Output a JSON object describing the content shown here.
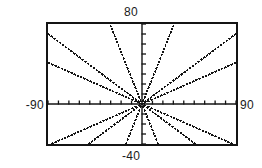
{
  "screen": {
    "type": "graphing-calculator-viewport",
    "background_color": "#ffffff",
    "ink_color": "#141414"
  },
  "labels": {
    "ymax": "80",
    "ymin": "-40",
    "xmin": "-90",
    "xmax": "90"
  },
  "chart_data": {
    "type": "line",
    "title": "",
    "xlabel": "",
    "ylabel": "",
    "xlim": [
      -90,
      90
    ],
    "ylim": [
      -40,
      80
    ],
    "xtick_spacing": 10,
    "ytick_spacing": 10,
    "grid": false,
    "legend": "none",
    "tick_labels": {
      "x": [
        "-90",
        "90"
      ],
      "y": [
        "80",
        "-40"
      ]
    },
    "series": [
      {
        "name": "line-1",
        "equation": "y = 2.6x",
        "slope": 2.6,
        "intercept": 0,
        "x": [
          -30,
          30
        ],
        "y": [
          -78,
          78
        ]
      },
      {
        "name": "line-2",
        "equation": "y = -2.6x",
        "slope": -2.6,
        "intercept": 0,
        "x": [
          -30,
          30
        ],
        "y": [
          78,
          -78
        ]
      },
      {
        "name": "line-3",
        "equation": "y = 0.78x",
        "slope": 0.78,
        "intercept": 0,
        "x": [
          -90,
          90
        ],
        "y": [
          -70,
          70
        ]
      },
      {
        "name": "line-4",
        "equation": "y = -0.78x",
        "slope": -0.78,
        "intercept": 0,
        "x": [
          -90,
          90
        ],
        "y": [
          70,
          -70
        ]
      },
      {
        "name": "line-5",
        "equation": "y = 0.46x",
        "slope": 0.46,
        "intercept": 0,
        "x": [
          -90,
          90
        ],
        "y": [
          -41,
          41
        ]
      },
      {
        "name": "line-6",
        "equation": "y = -0.46x",
        "slope": -0.46,
        "intercept": 0,
        "x": [
          -90,
          90
        ],
        "y": [
          41,
          -41
        ]
      }
    ]
  }
}
